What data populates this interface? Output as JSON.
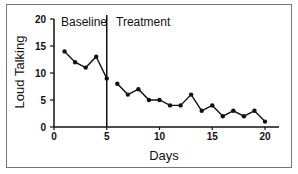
{
  "chart_data": {
    "type": "line",
    "title": "",
    "xlabel": "Days",
    "ylabel": "Loud Talking",
    "xlim": [
      0,
      21
    ],
    "ylim": [
      0,
      20
    ],
    "xticks": [
      0,
      5,
      10,
      15,
      20
    ],
    "yticks": [
      0,
      5,
      10,
      15,
      20
    ],
    "grid": false,
    "phase_line_x": 5,
    "phases": [
      {
        "name": "Baseline",
        "x": [
          1,
          2,
          3,
          4,
          5
        ],
        "values": [
          14,
          12,
          11,
          13,
          9
        ]
      },
      {
        "name": "Treatment",
        "x": [
          6,
          7,
          8,
          9,
          10,
          11,
          12,
          13,
          14,
          15,
          16,
          17,
          18,
          19,
          20
        ],
        "values": [
          8,
          6,
          7,
          5,
          5,
          4,
          4,
          6,
          3,
          4,
          2,
          3,
          2,
          3,
          1
        ]
      }
    ]
  },
  "labels": {
    "baseline": "Baseline",
    "treatment": "Treatment",
    "xlabel": "Days",
    "ylabel": "Loud Talking"
  },
  "ticks": {
    "x": [
      "0",
      "5",
      "10",
      "15",
      "20"
    ],
    "y": [
      "0",
      "5",
      "10",
      "15",
      "20"
    ]
  }
}
